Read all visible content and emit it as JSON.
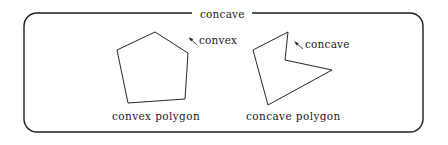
{
  "figure": {
    "background_color": "#ffffff",
    "ink_color": "#1a1a1a",
    "frame": {
      "name": "rounded-rectangle-frame",
      "x": 24,
      "y": 13,
      "width": 399,
      "height": 119,
      "corner_radius": 13,
      "stroke_color": "#1c1c1c",
      "stroke_width": 1.4,
      "top_rule_gap": {
        "left_end_x": 192,
        "right_end_x": 252
      }
    },
    "title_label": {
      "name": "top-concave-label",
      "text": "concave",
      "x": 196,
      "y": 9
    },
    "shapes": [
      {
        "name": "convex-polygon",
        "kind": "pentagon",
        "vertex_count": 5,
        "points": "155,32 188,53 185,99 128,103 117,50",
        "caption": "convex polygon",
        "caption_x": 112,
        "caption_y": 111,
        "annotation": {
          "name": "convex-vertex-annotation",
          "text": "convex",
          "text_x": 199,
          "text_y": 35,
          "arrow_from_x": 196,
          "arrow_from_y": 44,
          "arrow_to_x": 189,
          "arrow_to_y": 38
        }
      },
      {
        "name": "concave-polygon",
        "kind": "reflex-quadrilateral",
        "vertex_count": 5,
        "points": "288,32 285,60 332,70 268,105 253,50",
        "caption": "concave polygon",
        "caption_x": 246,
        "caption_y": 111,
        "annotation": {
          "name": "concave-vertex-annotation",
          "text": "concave",
          "text_x": 305,
          "text_y": 39,
          "arrow_from_x": 302,
          "arrow_from_y": 48,
          "arrow_to_x": 294,
          "arrow_to_y": 42
        }
      }
    ],
    "labels": {
      "top_concave": "concave",
      "convex_vertex": "convex",
      "concave_vertex": "concave",
      "convex_polygon_caption": "convex polygon",
      "concave_polygon_caption": "concave polygon"
    }
  }
}
